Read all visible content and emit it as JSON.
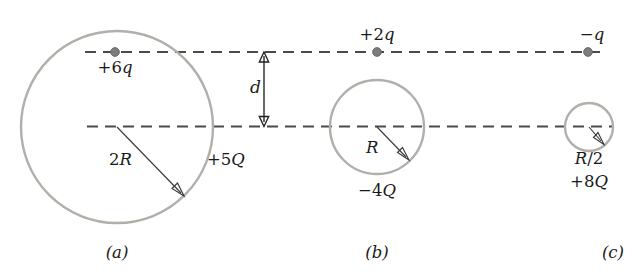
{
  "figure": {
    "colors": {
      "shell_stroke": "#b2aeaa",
      "axis_dash": "#4a4a4a",
      "charge_dot": "#7c7c7c",
      "arrow": "#3a3a3a",
      "text": "#1a1a1a",
      "background": "#ffffff"
    }
  },
  "axes": {
    "top_line_label": "upper-dashed-axis",
    "bottom_line_label": "lower-dashed-axis",
    "separation_label": "d"
  },
  "panels": [
    {
      "id": "a",
      "caption": "(a)",
      "point_charge": "+6q",
      "shell_charge": "+5Q",
      "radius_label": "2R",
      "radius_value_px": 96
    },
    {
      "id": "b",
      "caption": "(b)",
      "point_charge": "+2q",
      "shell_charge": "-4Q",
      "radius_label": "R",
      "radius_value_px": 47
    },
    {
      "id": "c",
      "caption": "(c)",
      "point_charge": "-q",
      "shell_charge": "+8Q",
      "radius_label": "R/2",
      "radius_value_px": 24
    }
  ]
}
